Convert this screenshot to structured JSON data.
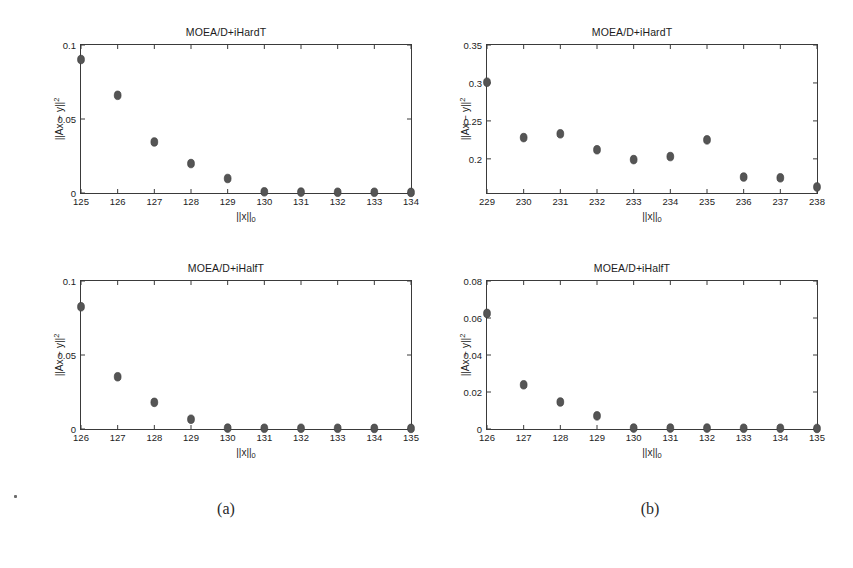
{
  "figure": {
    "subcaptions": [
      {
        "id": "a",
        "label": "(a)"
      },
      {
        "id": "b",
        "label": "(b)"
      }
    ],
    "axis_labels": {
      "x": "||x||0",
      "y": "||Ax - y||^2"
    },
    "marker_color": "#555555",
    "axis_color": "#3a3a3a",
    "background": "#ffffff"
  },
  "chart_data": [
    {
      "panel": "top-left",
      "type": "scatter",
      "title": "MOEA/D+iHardT",
      "xlabel": "||x||0",
      "ylabel": "||Ax - y||^2",
      "xlim": [
        125,
        134
      ],
      "ylim": [
        0,
        0.1
      ],
      "xticks": [
        125,
        126,
        127,
        128,
        129,
        130,
        131,
        132,
        133,
        134
      ],
      "xticklabels": [
        "125",
        "126",
        "127",
        "128",
        "129",
        "130",
        "131",
        "132",
        "133",
        "134"
      ],
      "yticks": [
        0,
        0.05,
        0.1
      ],
      "yticklabels": [
        "0",
        "0.05",
        "0.1"
      ],
      "grid": false,
      "legend": "none",
      "x": [
        125,
        126,
        127,
        128,
        129,
        130,
        131,
        132,
        133,
        134
      ],
      "values": [
        0.0902,
        0.066,
        0.0345,
        0.0199,
        0.0098,
        0.0008,
        0.0006,
        0.0005,
        0.0005,
        0.0004
      ]
    },
    {
      "panel": "top-right",
      "type": "scatter",
      "title": "MOEA/D+iHardT",
      "xlabel": "||x||0",
      "ylabel": "||Ax - y||^2",
      "xlim": [
        229,
        238
      ],
      "ylim": [
        0.155,
        0.35
      ],
      "xticks": [
        229,
        230,
        231,
        232,
        233,
        234,
        235,
        236,
        237,
        238
      ],
      "xticklabels": [
        "229",
        "230",
        "231",
        "232",
        "233",
        "234",
        "235",
        "236",
        "237",
        "238"
      ],
      "yticks": [
        0.2,
        0.25,
        0.3,
        0.35
      ],
      "yticklabels": [
        "0.2",
        "0.25",
        "0.3",
        "0.35"
      ],
      "grid": false,
      "legend": "none",
      "x": [
        229,
        230,
        231,
        232,
        233,
        234,
        235,
        236,
        237,
        238
      ],
      "values": [
        0.301,
        0.228,
        0.233,
        0.212,
        0.199,
        0.203,
        0.225,
        0.176,
        0.175,
        0.163
      ]
    },
    {
      "panel": "bottom-left",
      "type": "scatter",
      "title": "MOEA/D+iHalfT",
      "xlabel": "||x||0",
      "ylabel": "||Ax - y||^2",
      "xlim": [
        126,
        135
      ],
      "ylim": [
        0,
        0.1
      ],
      "xticks": [
        126,
        127,
        128,
        129,
        130,
        131,
        132,
        133,
        134,
        135
      ],
      "xticklabels": [
        "126",
        "127",
        "128",
        "129",
        "130",
        "131",
        "132",
        "133",
        "134",
        "135"
      ],
      "yticks": [
        0,
        0.05,
        0.1
      ],
      "yticklabels": [
        "0",
        "0.05",
        "0.1"
      ],
      "grid": false,
      "legend": "none",
      "x": [
        126,
        127,
        128,
        129,
        130,
        131,
        132,
        133,
        134,
        135
      ],
      "values": [
        0.0826,
        0.0353,
        0.018,
        0.0066,
        0.0006,
        0.0005,
        0.0005,
        0.0005,
        0.0004,
        0.0004
      ]
    },
    {
      "panel": "bottom-right",
      "type": "scatter",
      "title": "MOEA/D+iHalfT",
      "xlabel": "||x||0",
      "ylabel": "||Ax - y||^2",
      "xlim": [
        126,
        135
      ],
      "ylim": [
        0,
        0.08
      ],
      "xticks": [
        126,
        127,
        128,
        129,
        130,
        131,
        132,
        133,
        134,
        135
      ],
      "xticklabels": [
        "126",
        "127",
        "128",
        "129",
        "130",
        "131",
        "132",
        "133",
        "134",
        "135"
      ],
      "yticks": [
        0,
        0.02,
        0.04,
        0.06,
        0.08
      ],
      "yticklabels": [
        "0",
        "0.02",
        "0.04",
        "0.06",
        "0.08"
      ],
      "grid": false,
      "legend": "none",
      "x": [
        126,
        127,
        128,
        129,
        130,
        131,
        132,
        133,
        134,
        135
      ],
      "values": [
        0.0625,
        0.0239,
        0.0146,
        0.0071,
        0.0005,
        0.0005,
        0.0005,
        0.0004,
        0.0004,
        0.0003
      ]
    }
  ]
}
